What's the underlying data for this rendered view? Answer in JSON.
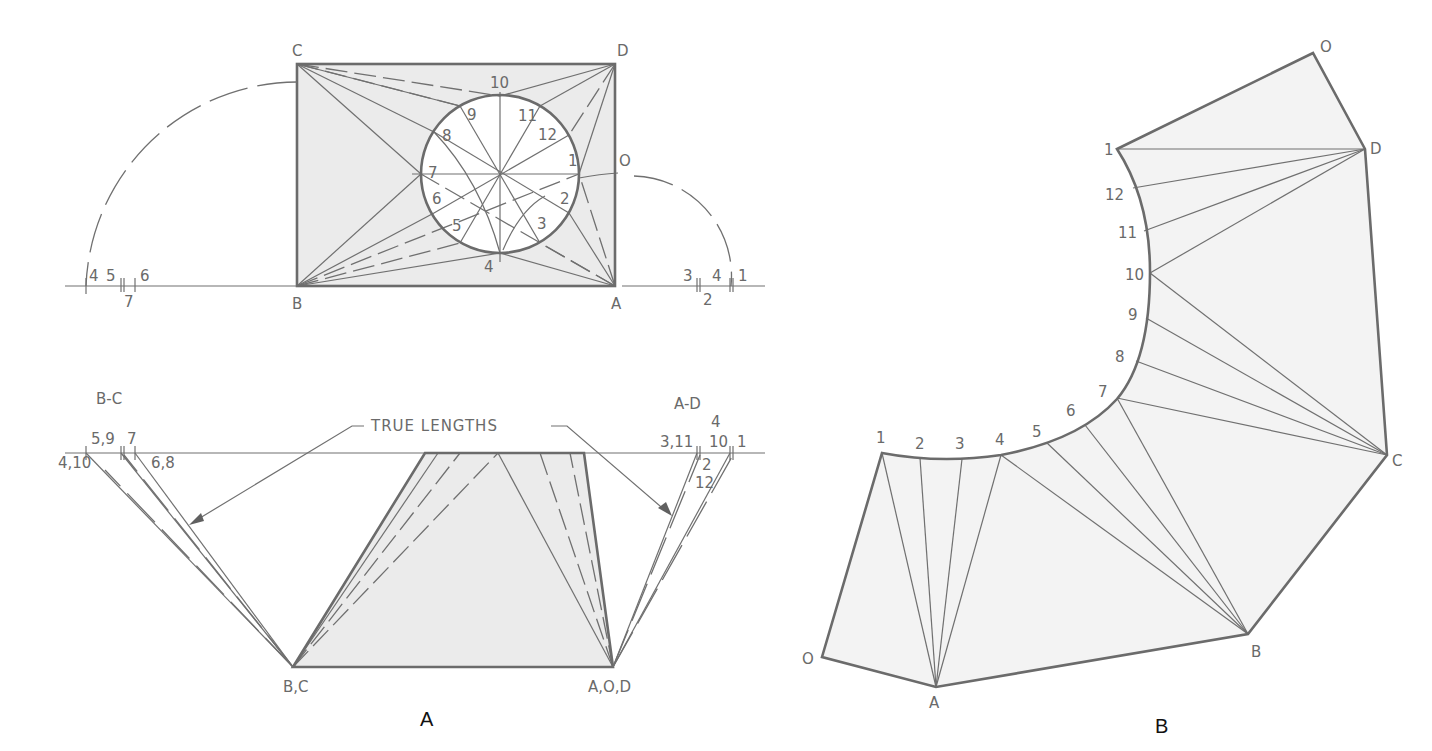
{
  "figure_a": {
    "caption": "A",
    "plan_view": {
      "corners": {
        "c": "C",
        "d": "D",
        "b": "B",
        "a": "A",
        "o": "O"
      },
      "circle_points": [
        "1",
        "2",
        "3",
        "4",
        "5",
        "6",
        "7",
        "8",
        "9",
        "10",
        "11",
        "12"
      ],
      "left_scale": {
        "labels": [
          "4",
          "5",
          "6"
        ],
        "below": "7"
      },
      "right_scale": {
        "labels": [
          "3",
          "4",
          "1"
        ],
        "below": "2"
      }
    },
    "true_length_diagram": {
      "title": "TRUE LENGTHS",
      "left_group_title": "B-C",
      "left_labels": {
        "l1": "4,10",
        "l2": "5,9",
        "l3": "7",
        "l4": "6,8"
      },
      "right_group_title": "A-D",
      "right_labels": {
        "r1": "3,11",
        "r2": "4",
        "r3": "10",
        "r4": "1",
        "r5": "2",
        "r6": "12"
      },
      "bottom_left": "B,C",
      "bottom_right": "A,O,D"
    }
  },
  "figure_b": {
    "caption": "B",
    "vertices": {
      "o_top": "O",
      "d": "D",
      "c": "C",
      "b": "B",
      "a": "A",
      "o_bottom": "O"
    },
    "curve_points": [
      "1",
      "2",
      "3",
      "4",
      "5",
      "6",
      "7",
      "8",
      "9",
      "10",
      "11",
      "12",
      "1"
    ]
  },
  "colors": {
    "line": "#6b6b6b",
    "fill": "#ebebeb",
    "background": "#ffffff"
  }
}
